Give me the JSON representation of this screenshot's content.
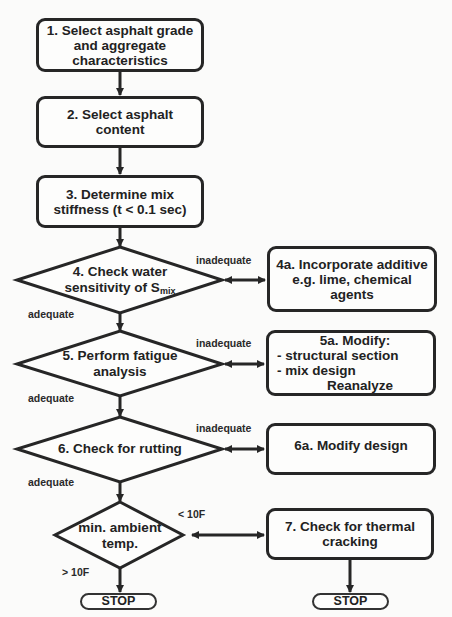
{
  "diagram": {
    "type": "flowchart",
    "nodes": [
      {
        "id": "1",
        "shape": "process",
        "lines": [
          "1. Select asphalt grade",
          "and aggregate",
          "characteristics"
        ]
      },
      {
        "id": "2",
        "shape": "process",
        "lines": [
          "2. Select asphalt",
          "content"
        ]
      },
      {
        "id": "3",
        "shape": "process",
        "lines": [
          "3. Determine mix",
          "stiffness (t < 0.1 sec)"
        ]
      },
      {
        "id": "4",
        "shape": "decision",
        "lines": [
          "4. Check water",
          "sensitivity of S"
        ],
        "subscript": "mix"
      },
      {
        "id": "4a",
        "shape": "process",
        "lines": [
          "4a. Incorporate additive",
          "e.g. lime, chemical",
          "agents"
        ]
      },
      {
        "id": "5",
        "shape": "decision",
        "lines": [
          "5. Perform fatigue",
          "analysis"
        ]
      },
      {
        "id": "5a",
        "shape": "process",
        "lines": [
          "5a. Modify:",
          "- structural section",
          "- mix design",
          "Reanalyze"
        ]
      },
      {
        "id": "6",
        "shape": "decision",
        "lines": [
          "6. Check for rutting"
        ]
      },
      {
        "id": "6a",
        "shape": "process",
        "lines": [
          "6a. Modify design"
        ]
      },
      {
        "id": "temp",
        "shape": "decision",
        "lines": [
          "min. ambient",
          "temp."
        ]
      },
      {
        "id": "7",
        "shape": "process",
        "lines": [
          "7. Check for thermal",
          "cracking"
        ]
      },
      {
        "id": "stop1",
        "shape": "terminal",
        "label": "STOP"
      },
      {
        "id": "stop2",
        "shape": "terminal",
        "label": "STOP"
      }
    ],
    "edge_labels": {
      "inadequate_4": "inadequate",
      "adequate_4": "adequate",
      "inadequate_5": "inadequate",
      "adequate_5": "adequate",
      "inadequate_6": "inadequate",
      "adequate_6": "adequate",
      "lt_10f": "< 10F",
      "gt_10f": "> 10F"
    },
    "edges": [
      {
        "from": "1",
        "to": "2"
      },
      {
        "from": "2",
        "to": "3"
      },
      {
        "from": "3",
        "to": "4"
      },
      {
        "from": "4",
        "to": "4a",
        "label": "inadequate",
        "bidirectional": true
      },
      {
        "from": "4",
        "to": "5",
        "label": "adequate"
      },
      {
        "from": "5",
        "to": "5a",
        "label": "inadequate",
        "bidirectional": true
      },
      {
        "from": "5",
        "to": "6",
        "label": "adequate"
      },
      {
        "from": "6",
        "to": "6a",
        "label": "inadequate",
        "bidirectional": true
      },
      {
        "from": "6",
        "to": "temp",
        "label": "adequate"
      },
      {
        "from": "temp",
        "to": "7",
        "label": "< 10F",
        "bidirectional": true
      },
      {
        "from": "temp",
        "to": "stop1",
        "label": "> 10F"
      },
      {
        "from": "7",
        "to": "stop2"
      }
    ],
    "colors": {
      "stroke": "#262626",
      "background": "#fbfbfa"
    }
  }
}
